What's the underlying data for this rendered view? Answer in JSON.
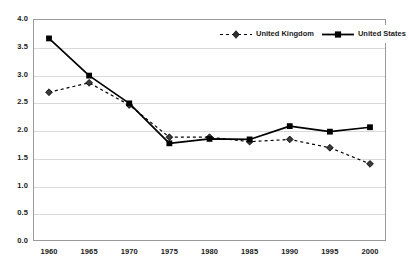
{
  "chart": {
    "title": "",
    "subtitle": "",
    "background_color": "#ffffff",
    "series_color": "#000000",
    "gridline_color": "#d9d9d9",
    "frame_color": "#9a9a9a"
  },
  "legend": {
    "position": "top-right",
    "entries": [
      {
        "label": "United Kingdom",
        "style": "dashed",
        "marker": "diamond"
      },
      {
        "label": "United States",
        "style": "solid",
        "marker": "square"
      }
    ]
  },
  "chart_data": {
    "type": "line",
    "title": "",
    "xlabel": "",
    "ylabel": "",
    "x": [
      1960,
      1965,
      1970,
      1975,
      1980,
      1985,
      1990,
      1995,
      2000
    ],
    "categories": [
      "1960",
      "1965",
      "1970",
      "1975",
      "1980",
      "1985",
      "1990",
      "1995",
      "2000"
    ],
    "xtick_labels": [
      "1960",
      "1965",
      "1970",
      "1975",
      "1980",
      "1985",
      "1990",
      "1995",
      "2000"
    ],
    "ytick_labels": [
      "0.0",
      "0.5",
      "1.0",
      "1.5",
      "2.0",
      "2.5",
      "3.0",
      "3.5",
      "4.0"
    ],
    "ylim": [
      0.0,
      4.0
    ],
    "xlim": [
      1960,
      2000
    ],
    "ytick_step": 0.5,
    "grid": true,
    "legend_position": "top-right",
    "series": [
      {
        "name": "United Kingdom",
        "style": "dashed",
        "marker": "diamond",
        "values": [
          2.68,
          2.85,
          2.45,
          1.87,
          1.87,
          1.79,
          1.83,
          1.68,
          1.39
        ]
      },
      {
        "name": "United States",
        "style": "solid",
        "marker": "square",
        "values": [
          3.65,
          2.98,
          2.48,
          1.76,
          1.84,
          1.83,
          2.07,
          1.97,
          2.05
        ]
      }
    ]
  }
}
